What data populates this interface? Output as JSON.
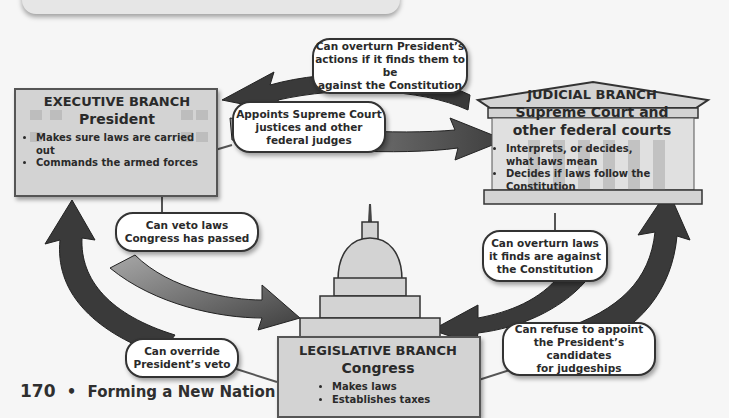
{
  "diagram": {
    "branches": {
      "executive": {
        "title": "EXECUTIVE BRANCH",
        "subtitle": "President",
        "powers": [
          "Makes sure laws are carried out",
          "Commands the armed forces"
        ],
        "icon": "white-house-icon"
      },
      "judicial": {
        "title": "JUDICIAL BRANCH",
        "subtitle_line1": "Supreme Court and",
        "subtitle_line2": "other federal courts",
        "powers": [
          "Interprets, or decides, what laws mean",
          "Decides if laws follow the Constitution"
        ],
        "icon": "courthouse-icon"
      },
      "legislative": {
        "title": "LEGISLATIVE BRANCH",
        "subtitle": "Congress",
        "powers": [
          "Makes laws",
          "Establishes taxes"
        ],
        "icon": "capitol-dome-icon"
      }
    },
    "checks": {
      "judicial_to_executive": {
        "line1": "Can overturn President’s",
        "line2": "actions if it finds them to be",
        "line3": "against the Constitution"
      },
      "executive_to_judicial": {
        "line1": "Appoints Supreme Court",
        "line2": "justices and other",
        "line3": "federal judges"
      },
      "executive_to_legislative": {
        "line1": "Can veto laws",
        "line2": "Congress has passed"
      },
      "legislative_to_executive": {
        "line1": "Can override",
        "line2": "President’s veto"
      },
      "judicial_to_legislative": {
        "line1": "Can overturn laws",
        "line2": "it finds are against",
        "line3": "the Constitution"
      },
      "legislative_to_judicial": {
        "line1": "Can refuse to appoint",
        "line2": "the President’s candidates",
        "line3": "for judgeships"
      }
    },
    "colors": {
      "arrow_dark": "#3a3a3a",
      "arrow_mid": "#5a5a5a",
      "box_fill": "#d3d3d3",
      "callout_border": "#333333"
    }
  },
  "footer": {
    "page_number": "170",
    "separator": "•",
    "chapter": "Forming a New Nation"
  }
}
